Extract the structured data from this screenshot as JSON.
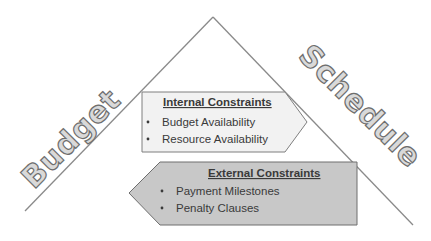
{
  "diagram": {
    "type": "triangle-constraints",
    "left_side_label": "Budget",
    "right_side_label": "Schedule",
    "internal": {
      "title": "Internal Constraints",
      "items": [
        "Budget Availability",
        "Resource Availability"
      ],
      "fill": "#f2f2f2",
      "stroke": "#7f7f7f",
      "direction": "right"
    },
    "external": {
      "title": "External Constraints",
      "items": [
        "Payment Milestones",
        "Penalty Clauses"
      ],
      "fill": "#c8c8c8",
      "stroke": "#6e6e6e",
      "direction": "left"
    },
    "colors": {
      "line": "#808080",
      "label_fill": "#d9d9d9",
      "label_stroke": "#6e6e6e",
      "text": "#3a3a3a"
    }
  }
}
